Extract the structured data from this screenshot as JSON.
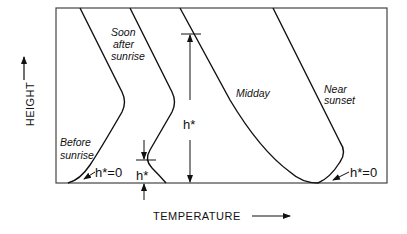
{
  "diagram": {
    "type": "temperature-height profiles",
    "axes": {
      "x_label": "TEMPERATURE",
      "y_label": "HEIGHT"
    },
    "curves": [
      {
        "id": "before-sunrise",
        "label_line1": "Before",
        "label_line2": "sunrise"
      },
      {
        "id": "soon-after-sunrise",
        "label_line1": "Soon",
        "label_line2": "after",
        "label_line3": "sunrise"
      },
      {
        "id": "midday",
        "label_line1": "Midday"
      },
      {
        "id": "near-sunset",
        "label_line1": "Near",
        "label_line2": "sunset"
      }
    ],
    "annotations": {
      "before_sunrise_h": "h*=0",
      "soon_after_h": "h*",
      "midday_h": "h*",
      "near_sunset_h": "h*=0"
    },
    "colors": {
      "line": "#111111",
      "background": "#ffffff"
    }
  }
}
